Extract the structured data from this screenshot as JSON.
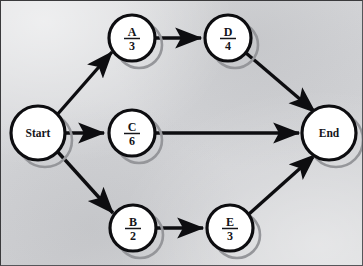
{
  "diagram": {
    "type": "directed-graph",
    "background_color": "#d4d5d7",
    "node_fill": "#ffffff",
    "node_stroke": "#0d0d10",
    "shadow_color": "#9a9b9f",
    "edge_color": "#0d0d10",
    "nodes": [
      {
        "id": "start",
        "label": "Start",
        "kind": "terminator",
        "cx": 38,
        "cy": 133,
        "r": 27
      },
      {
        "id": "a",
        "label": "A",
        "duration": "3",
        "kind": "activity",
        "cx": 132,
        "cy": 38,
        "r": 23
      },
      {
        "id": "d",
        "label": "D",
        "duration": "4",
        "kind": "activity",
        "cx": 228,
        "cy": 38,
        "r": 23
      },
      {
        "id": "c",
        "label": "C",
        "duration": "6",
        "kind": "activity",
        "cx": 132,
        "cy": 133,
        "r": 23
      },
      {
        "id": "b",
        "label": "B",
        "duration": "2",
        "kind": "activity",
        "cx": 133,
        "cy": 228,
        "r": 23
      },
      {
        "id": "e",
        "label": "E",
        "duration": "3",
        "kind": "activity",
        "cx": 230,
        "cy": 228,
        "r": 23
      },
      {
        "id": "end",
        "label": "End",
        "kind": "terminator",
        "cx": 329,
        "cy": 133,
        "r": 27
      }
    ],
    "edges": [
      {
        "id": "start-a",
        "from": "start",
        "to": "a"
      },
      {
        "id": "start-c",
        "from": "start",
        "to": "c"
      },
      {
        "id": "start-b",
        "from": "start",
        "to": "b"
      },
      {
        "id": "a-d",
        "from": "a",
        "to": "d"
      },
      {
        "id": "d-end",
        "from": "d",
        "to": "end"
      },
      {
        "id": "c-end",
        "from": "c",
        "to": "end"
      },
      {
        "id": "b-e",
        "from": "b",
        "to": "e"
      },
      {
        "id": "e-end",
        "from": "e",
        "to": "end"
      }
    ]
  }
}
